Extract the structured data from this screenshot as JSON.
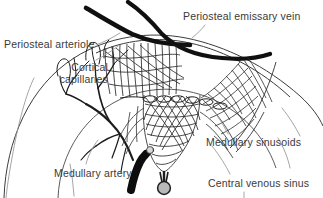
{
  "figure": {
    "background_color": "#ffffff",
    "ink_color": "#1a1a1a",
    "leader_color": "#8c8c8c",
    "label_color": "#3a3a3a",
    "vessel_fill": "#111111",
    "sinus_fill": "#b5b5b5"
  },
  "labels": {
    "periosteal_emissary_vein": "Periosteal emissary vein",
    "periosteal_arteriole": "Periosteal arteriole",
    "cortical_capillaries_line1": "Cortical",
    "cortical_capillaries_line2": "capillaries",
    "medullary_sinusoids": "Medullary sinusoids",
    "medullary_artery": "Medullary artery",
    "central_venous_sinus": "Central venous sinus"
  },
  "structures": [
    {
      "name": "periosteal-emissary-vein",
      "style": "thick-black-curve"
    },
    {
      "name": "periosteal-arteriole",
      "style": "thick-black-curve"
    },
    {
      "name": "cortical-capillaries",
      "style": "thin-branching-network"
    },
    {
      "name": "medullary-sinusoids",
      "style": "thin-mesh-network"
    },
    {
      "name": "medullary-artery",
      "style": "thick-black-taper"
    },
    {
      "name": "central-venous-sinus",
      "style": "gray-filled-circle"
    },
    {
      "name": "bone-cortex-outline",
      "style": "thin-curve"
    },
    {
      "name": "marrow-cavity-outline",
      "style": "thin-curve"
    }
  ]
}
